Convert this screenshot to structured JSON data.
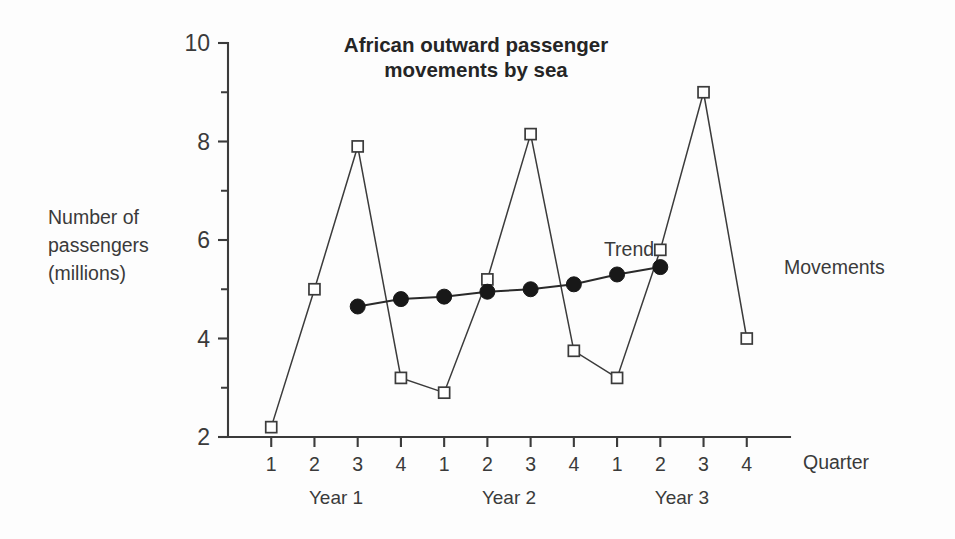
{
  "chart_data": {
    "type": "line",
    "title": "African outward passenger movements by sea",
    "title_line1": "African outward passenger",
    "title_line2": "movements by sea",
    "xlabel": "Quarter",
    "ylabel": "Number of passengers (millions)",
    "ylabel_line1": "Number of",
    "ylabel_line2": "passengers",
    "ylabel_line3": "(millions)",
    "ylim": [
      2,
      10
    ],
    "ytick_labels": [
      "2",
      "4",
      "6",
      "8",
      "10"
    ],
    "ytick_values": [
      2,
      4,
      6,
      8,
      10
    ],
    "yminor_values": [
      3,
      5,
      7,
      9
    ],
    "grid": false,
    "legend_position": "inline-annotation",
    "categories": [
      "1",
      "2",
      "3",
      "4",
      "1",
      "2",
      "3",
      "4",
      "1",
      "2",
      "3",
      "4"
    ],
    "x_index": [
      1,
      2,
      3,
      4,
      5,
      6,
      7,
      8,
      9,
      10,
      11,
      12
    ],
    "group_labels": [
      {
        "label": "Year 1",
        "start_index": 1,
        "end_index": 4,
        "center_index": 2.5
      },
      {
        "label": "Year 2",
        "start_index": 5,
        "end_index": 8,
        "center_index": 6.5
      },
      {
        "label": "Year 3",
        "start_index": 9,
        "end_index": 12,
        "center_index": 10.5
      }
    ],
    "series": [
      {
        "name": "Movements",
        "marker": "open-square",
        "x": [
          1,
          2,
          3,
          4,
          5,
          6,
          7,
          8,
          9,
          10,
          11,
          12
        ],
        "values": [
          2.2,
          5.0,
          7.9,
          3.2,
          2.9,
          5.2,
          8.15,
          3.75,
          3.2,
          5.8,
          9.0,
          4.0
        ]
      },
      {
        "name": "Trend",
        "marker": "filled-circle",
        "x": [
          3,
          4,
          5,
          6,
          7,
          8,
          9,
          10
        ],
        "values": [
          4.65,
          4.8,
          4.85,
          4.95,
          5.0,
          5.1,
          5.3,
          5.45
        ]
      }
    ],
    "annotations": [
      {
        "text": "Trend",
        "series": "Trend",
        "anchor_index": 7.05,
        "anchor_value": 5.9
      },
      {
        "text": "Movements",
        "series": "Movements",
        "anchor_index": 11.35,
        "anchor_value": 5.35
      }
    ],
    "colors": {
      "axis": "#3b3b3b",
      "movements_line": "#3b3b3b",
      "movements_marker_fill": "#ffffff",
      "trend_line": "#2a2a2a",
      "trend_marker_fill": "#181818",
      "text": "#3a3a3a",
      "title": "#252525",
      "background": "#fdfdfd"
    }
  }
}
